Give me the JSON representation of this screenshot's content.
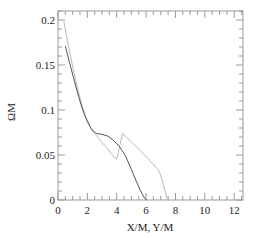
{
  "chart_data": {
    "type": "line",
    "title": "",
    "xlabel": "X/M, Y/M",
    "ylabel": "ΩM",
    "xlim": [
      0,
      12.6
    ],
    "ylim": [
      0,
      0.21
    ],
    "xticks": [
      0,
      2,
      4,
      6,
      8,
      10,
      12
    ],
    "xtick_labels": [
      "0",
      "2",
      "4",
      "6",
      "8",
      "10",
      "12"
    ],
    "yticks": [
      0,
      0.05,
      0.1,
      0.15,
      0.2
    ],
    "ytick_labels": [
      "0",
      "0.05",
      "0.1",
      "0.15",
      "0.2"
    ],
    "grid": false,
    "legend": null,
    "series": [
      {
        "name": "dark curve",
        "color": "#555555",
        "x": [
          0.5,
          0.8,
          1.1,
          1.4,
          1.7,
          2.0,
          2.3,
          2.6,
          3.0,
          3.4,
          3.8,
          4.2,
          4.6,
          5.0,
          5.3,
          5.6,
          5.9,
          6.05
        ],
        "y": [
          0.171,
          0.152,
          0.133,
          0.115,
          0.099,
          0.087,
          0.078,
          0.074,
          0.073,
          0.071,
          0.066,
          0.059,
          0.049,
          0.034,
          0.022,
          0.011,
          0.002,
          0.0
        ]
      },
      {
        "name": "light curve",
        "color": "#b8b8b8",
        "x": [
          0.4,
          0.7,
          1.0,
          1.3,
          1.6,
          1.9,
          2.2,
          2.5,
          2.9,
          3.3,
          3.7,
          4.0,
          4.4,
          4.9,
          5.4,
          5.9,
          6.4,
          6.9,
          7.2,
          7.45
        ],
        "y": [
          0.198,
          0.172,
          0.148,
          0.126,
          0.107,
          0.092,
          0.081,
          0.074,
          0.066,
          0.058,
          0.05,
          0.045,
          0.074,
          0.066,
          0.058,
          0.05,
          0.041,
          0.032,
          0.016,
          0.0
        ]
      }
    ]
  }
}
